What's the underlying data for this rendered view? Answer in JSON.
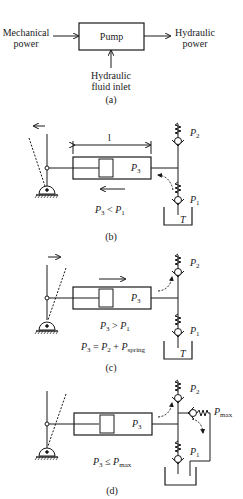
{
  "panel_a": {
    "input_label_1": "Mechanical",
    "input_label_2": "power",
    "pump_label": "Pump",
    "output_label_1": "Hydraulic",
    "output_label_2": "power",
    "inlet_label_1": "Hydraulic",
    "inlet_label_2": "fluid inlet",
    "caption": "(a)"
  },
  "panel_b": {
    "dimension_label": "l",
    "chamber_pressure": "P",
    "chamber_pressure_sub": "3",
    "valve_top": "P",
    "valve_top_sub": "2",
    "valve_bottom": "P",
    "valve_bottom_sub": "1",
    "tank_label": "T",
    "condition_lhs": "P",
    "condition_lhs_sub": "3",
    "condition_op": " < ",
    "condition_rhs": "P",
    "condition_rhs_sub": "1",
    "caption": "(b)"
  },
  "panel_c": {
    "chamber_pressure": "P",
    "chamber_pressure_sub": "3",
    "valve_top": "P",
    "valve_top_sub": "2",
    "valve_bottom": "P",
    "valve_bottom_sub": "1",
    "tank_label": "T",
    "condition1_lhs": "P",
    "condition1_lhs_sub": "3",
    "condition1_op": " > ",
    "condition1_rhs": "P",
    "condition1_rhs_sub": "1",
    "condition2_lhs": "P",
    "condition2_lhs_sub": "3",
    "condition2_op": " = ",
    "condition2_a": "P",
    "condition2_a_sub": "2",
    "condition2_plus": " + ",
    "condition2_b": "P",
    "condition2_b_sub": "spring",
    "caption": "(c)"
  },
  "panel_d": {
    "chamber_pressure": "P",
    "chamber_pressure_sub": "3",
    "valve_top": "P",
    "valve_top_sub": "2",
    "valve_bottom": "P",
    "valve_bottom_sub": "1",
    "relief_valve": "P",
    "relief_valve_sub": "max",
    "condition_lhs": "P",
    "condition_lhs_sub": "3",
    "condition_op": " ≤ ",
    "condition_rhs": "P",
    "condition_rhs_sub": "max",
    "caption": "(d)"
  }
}
